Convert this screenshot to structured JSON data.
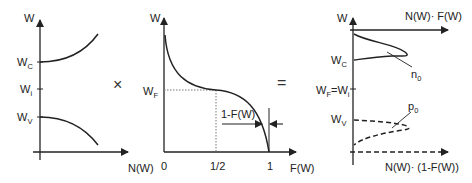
{
  "panel1": {
    "y_axis_label": "W",
    "x_axis_label": "N(W)",
    "ticks": [
      {
        "main": "W",
        "sub": "C"
      },
      {
        "main": "W",
        "sub": "i"
      },
      {
        "main": "W",
        "sub": "V"
      }
    ]
  },
  "operator_times": "×",
  "panel2": {
    "y_axis_label": "W",
    "x_axis_label": "F(W)",
    "y_tick": {
      "main": "W",
      "sub": "F"
    },
    "x_ticks": [
      "0",
      "1/2",
      "1"
    ],
    "annotation": "1-F(W)"
  },
  "operator_equals": "=",
  "panel3": {
    "y_axis_label": "W",
    "top_axis_label": "N(W)· F(W)",
    "bottom_axis_label": "N(W)· (1-F(W))",
    "ticks": [
      {
        "main": "W",
        "sub": "C"
      },
      {
        "main": "W",
        "sub": "F",
        "suffix": "=W",
        "suffix_sub": "i"
      },
      {
        "main": "W",
        "sub": "V"
      }
    ],
    "curve_labels": {
      "electrons": {
        "main": "n",
        "sub": "0"
      },
      "holes": {
        "main": "p",
        "sub": "0"
      }
    }
  },
  "colors": {
    "line": "#222222",
    "dotted": "#777777"
  }
}
